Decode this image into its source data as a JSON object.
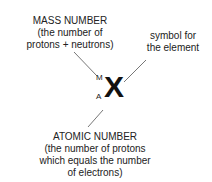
{
  "diagram": {
    "mass_number": {
      "title": "MASS NUMBER",
      "line1": "(the number of",
      "line2": "protons + neutrons)"
    },
    "symbol_note": {
      "line1": "symbol for",
      "line2": "the element"
    },
    "atomic_number": {
      "title": "ATOMIC NUMBER",
      "line1": "(the number of protons",
      "line2": "which equals the number",
      "line3": "of electrons)"
    },
    "notation": {
      "mass_label": "M",
      "atomic_label": "A",
      "symbol": "X"
    }
  }
}
